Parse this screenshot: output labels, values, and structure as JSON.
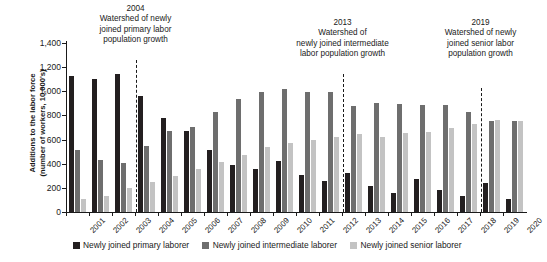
{
  "chart_data": {
    "type": "bar",
    "title": "",
    "xlabel": "",
    "ylabel": "Additions to the labor force (number of workers, 10,000's)",
    "ylabel_lines": [
      "Additions to the labor force",
      "(number of workers, 10,000's)"
    ],
    "ylim": [
      0,
      1400
    ],
    "yticks": [
      0,
      200,
      400,
      600,
      800,
      1000,
      1200,
      1400
    ],
    "ytick_labels": [
      "0",
      "200",
      "400",
      "600",
      "800",
      "1,000",
      "1,200",
      "1,400"
    ],
    "grid": false,
    "legend_position": "bottom",
    "categories": [
      "2001",
      "2002",
      "2003",
      "2004",
      "2005",
      "2006",
      "2007",
      "2008",
      "2009",
      "2010",
      "2011",
      "2012",
      "2013",
      "2014",
      "2015",
      "2016",
      "2017",
      "2018",
      "2019",
      "2020"
    ],
    "series": [
      {
        "name": "Newly joined primary laborer",
        "color": "#231f20",
        "values": [
          1125,
          1105,
          1145,
          960,
          775,
          670,
          510,
          390,
          355,
          425,
          305,
          255,
          325,
          215,
          160,
          275,
          185,
          130,
          240,
          110
        ]
      },
      {
        "name": "Newly joined intermediate laborer",
        "color": "#6e6e6e",
        "values": [
          510,
          435,
          410,
          545,
          675,
          705,
          825,
          935,
          995,
          1015,
          995,
          995,
          880,
          900,
          895,
          890,
          885,
          830,
          750,
          755
        ]
      },
      {
        "name": "Newly joined senior laborer",
        "color": "#c3c3c3",
        "values": [
          105,
          130,
          200,
          250,
          300,
          360,
          415,
          470,
          540,
          570,
          595,
          625,
          645,
          620,
          655,
          660,
          695,
          725,
          765,
          750
        ]
      }
    ],
    "annotations": [
      {
        "year": "2004",
        "at_category": "2004",
        "lines": [
          "2004",
          "Watershed of newly",
          "joined primary labor",
          "population growth"
        ],
        "text_lines": [
          "Watershed of newly",
          "joined primary labor",
          "population growth"
        ]
      },
      {
        "year": "2013",
        "at_category": "2013",
        "lines": [
          "2013",
          "Watershed of",
          "newly joined intermediate",
          "labor population growth"
        ],
        "text_lines": [
          "Watershed of",
          "newly joined intermediate",
          "labor population growth"
        ]
      },
      {
        "year": "2019",
        "at_category": "2019",
        "lines": [
          "2019",
          "Watershed of newly",
          "joined senior labor",
          "population growth"
        ],
        "text_lines": [
          "Watershed of newly",
          "joined senior labor",
          "population growth"
        ]
      }
    ]
  }
}
